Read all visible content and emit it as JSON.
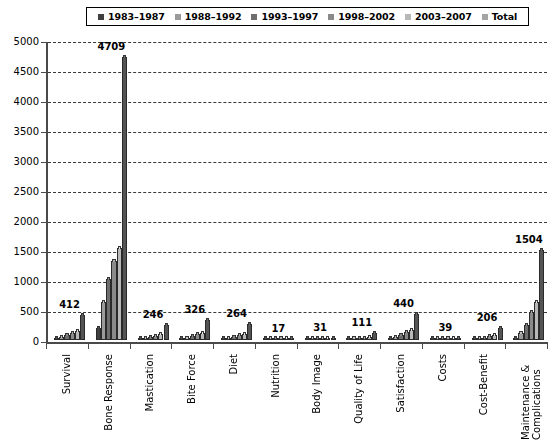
{
  "chart_data": {
    "type": "bar",
    "title": "",
    "xlabel": "",
    "ylabel": "",
    "ylim": [
      0,
      5000
    ],
    "yticks": [
      0,
      500,
      1000,
      1500,
      2000,
      2500,
      3000,
      3500,
      4000,
      4500,
      5000
    ],
    "grid": true,
    "legend_position": "top",
    "categories": [
      "Survival",
      "Bone Response",
      "Mastication",
      "Bite Force",
      "Diet",
      "Nutrition",
      "Body Image",
      "Quality of Life",
      "Satisfaction",
      "Costs",
      "Cost-Benefit",
      "Maintenance & Complications"
    ],
    "series": [
      {
        "name": "1983–1987",
        "color": "#3f3f3f",
        "values": [
          18,
          205,
          9,
          12,
          11,
          1,
          1,
          2,
          14,
          2,
          6,
          36
        ]
      },
      {
        "name": "1988–1992",
        "color": "#9a9a9a",
        "values": [
          52,
          640,
          24,
          31,
          28,
          2,
          3,
          9,
          45,
          4,
          18,
          120
        ]
      },
      {
        "name": "1993–1997",
        "color": "#6e6e6e",
        "values": [
          86,
          1010,
          48,
          62,
          51,
          3,
          5,
          19,
          84,
          7,
          36,
          256
        ]
      },
      {
        "name": "1998–2002",
        "color": "#8a8a8a",
        "values": [
          114,
          1325,
          72,
          96,
          78,
          5,
          9,
          35,
          129,
          11,
          59,
          462
        ]
      },
      {
        "name": "2003–2007",
        "color": "#b8b8b8",
        "values": [
          142,
          1529,
          93,
          125,
          96,
          6,
          13,
          46,
          168,
          15,
          87,
          630
        ]
      },
      {
        "name": "Total",
        "color": "#545454",
        "values": [
          412,
          4709,
          246,
          326,
          264,
          17,
          31,
          111,
          440,
          39,
          206,
          1504
        ]
      }
    ],
    "total_labels": [
      412,
      4709,
      246,
      326,
      264,
      17,
      31,
      111,
      440,
      39,
      206,
      1504
    ]
  },
  "legend": {
    "items": [
      {
        "label": "1983–1987",
        "swatch": "#3f3f3f"
      },
      {
        "label": "1988–1992",
        "swatch": "#9a9a9a"
      },
      {
        "label": "1993–1997",
        "swatch": "#6e6e6e"
      },
      {
        "label": "1998–2002",
        "swatch": "#8a8a8a"
      },
      {
        "label": "2003–2007",
        "swatch": "#b8b8b8"
      },
      {
        "label": "Total",
        "swatch": "#a4a4a4"
      }
    ]
  },
  "axes": {
    "y_tick_labels": [
      "5000",
      "4500",
      "4000",
      "3500",
      "3000",
      "2500",
      "2000",
      "1500",
      "1000",
      "500",
      "0"
    ],
    "x_tick_labels": [
      "Survival",
      "Bone Response",
      "Mastication",
      "Bite Force",
      "Diet",
      "Nutrition",
      "Body Image",
      "Quality of Life",
      "Satisfaction",
      "Costs",
      "Cost-Benefit",
      "Maintenance & Complications"
    ]
  }
}
